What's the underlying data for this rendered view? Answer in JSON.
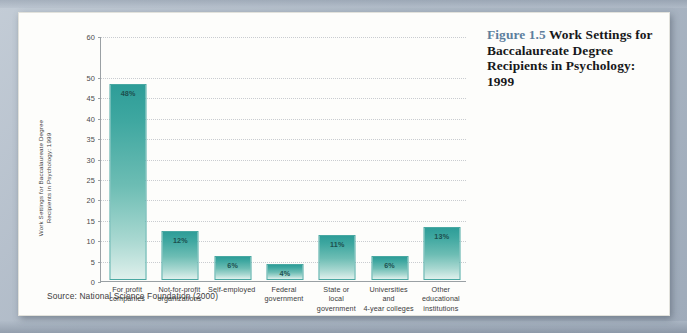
{
  "caption": {
    "figure_number": "Figure 1.5",
    "title": "Work Settings for Baccalaureate Degree Recipients in Psychology: 1999"
  },
  "source_note": "Source: National Science Foundation (2000)",
  "colors": {
    "figure_number": "#5d7f9e",
    "bar_top": "#2e9d98",
    "bar_bottom": "#dff0ec",
    "bar_border": "#49a8a2",
    "axis": "#9aa0a4",
    "gridline": "#c9ccd0",
    "card_background": "#fdfdfb",
    "page_background": "#b9c4cf"
  },
  "chart_data": {
    "type": "bar",
    "title": "Work Settings for Baccalaureate Degree Recipients in Psychology: 1999",
    "xlabel": "",
    "ylabel": "Work Settings for Baccalaureate Degree Recipients in Psychology: 1999",
    "ylabel_lines": [
      "Work Settings for Baccalaureate Degree",
      "Recipients in Psychology: 1999"
    ],
    "categories": [
      "For profit companies",
      "Not-for-profit organizations",
      "Self-employed",
      "Federal government",
      "State or local government",
      "Universities and 4-year colleges",
      "Other educational institutions"
    ],
    "category_lines": [
      [
        "For profit",
        "companies"
      ],
      [
        "Not-for-profit",
        "organizations"
      ],
      [
        "Self-employed"
      ],
      [
        "Federal",
        "government"
      ],
      [
        "State or",
        "local",
        "government"
      ],
      [
        "Universities",
        "and",
        "4-year colleges"
      ],
      [
        "Other",
        "educational",
        "institutions"
      ]
    ],
    "values": [
      48,
      12,
      6,
      4,
      11,
      6,
      13
    ],
    "data_labels": [
      "48%",
      "12%",
      "6%",
      "4%",
      "11%",
      "6%",
      "13%"
    ],
    "ylim": [
      0,
      60
    ],
    "ytick_labels": [
      "60",
      "50",
      "45",
      "40",
      "35",
      "30",
      "25",
      "20",
      "15",
      "10",
      "5",
      "0"
    ],
    "ytick_values": [
      60,
      50,
      45,
      40,
      35,
      30,
      25,
      20,
      15,
      10,
      5,
      0
    ],
    "grid": true,
    "legend": "none",
    "units": "percent"
  }
}
